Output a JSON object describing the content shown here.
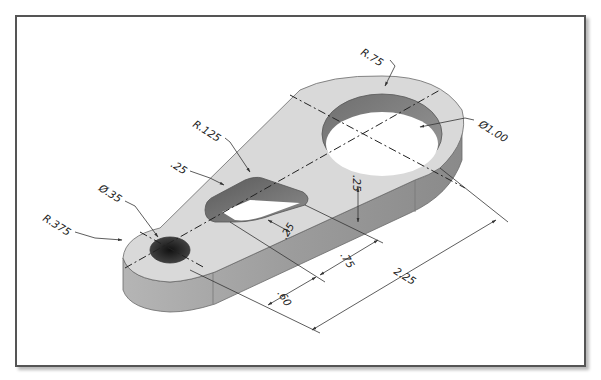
{
  "drawing": {
    "type": "isometric-part-drawing",
    "part": "link-arm",
    "colors": {
      "frame": "#555555",
      "top_face": "#d9d9d9",
      "side_face": "#a8a8a8",
      "side_face_dark": "#8f8f8f",
      "hole_dark": "#2a2a2a",
      "ring_inner": "#7d7d7d",
      "dimension_line": "#333333",
      "centerline": "#222222"
    },
    "dimensions": [
      {
        "id": "r-large",
        "label": "R.75"
      },
      {
        "id": "dia-large",
        "label": "Ø1.00"
      },
      {
        "id": "r-slot",
        "label": "R.125"
      },
      {
        "id": "slot-offset",
        "label": ".25"
      },
      {
        "id": "dia-small",
        "label": "Ø.35"
      },
      {
        "id": "r-small",
        "label": "R.375"
      },
      {
        "id": "thickness",
        "label": ".25"
      },
      {
        "id": "slot-width",
        "label": ".25"
      },
      {
        "id": "slot-length",
        "label": ".75"
      },
      {
        "id": "hole-to-slot",
        "label": ".60"
      },
      {
        "id": "center-distance",
        "label": "2.25"
      }
    ]
  }
}
